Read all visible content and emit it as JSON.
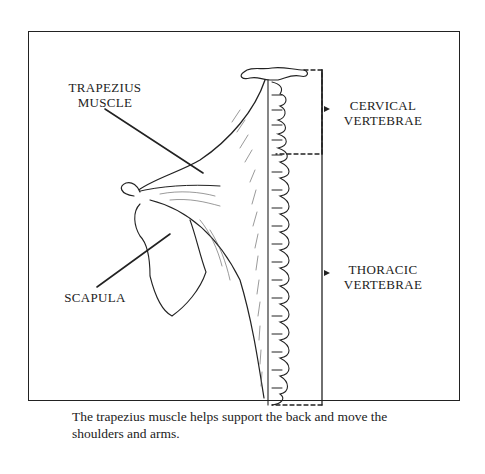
{
  "figure": {
    "labels": {
      "trapezius": [
        "TRAPEZIUS",
        "MUSCLE"
      ],
      "cervical": [
        "CERVICAL",
        "VERTEBRAE"
      ],
      "scapula": "SCAPULA",
      "thoracic": [
        "THORACIC",
        "VERTEBRAE"
      ]
    },
    "caption": "The trapezius muscle helps support the back and move the shoulders and arms.",
    "colors": {
      "ink": "#222222",
      "background": "#ffffff"
    }
  }
}
